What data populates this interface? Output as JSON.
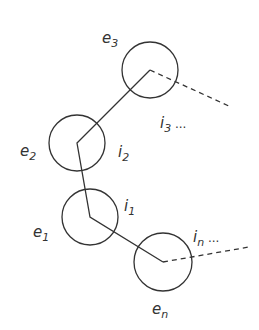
{
  "diagram": {
    "nodes": [
      {
        "id": "e3",
        "label": "e",
        "sub": "3",
        "cx": 150,
        "cy": 70,
        "r": 28,
        "lx": 102,
        "ly": 43
      },
      {
        "id": "e2",
        "label": "e",
        "sub": "2",
        "cx": 77,
        "cy": 143,
        "r": 28,
        "lx": 20,
        "ly": 156
      },
      {
        "id": "e1",
        "label": "e",
        "sub": "1",
        "cx": 90,
        "cy": 217,
        "r": 28,
        "lx": 33,
        "ly": 237
      },
      {
        "id": "en",
        "label": "e",
        "sub": "n",
        "cx": 163,
        "cy": 262,
        "r": 29,
        "lx": 152,
        "ly": 314
      }
    ],
    "index_labels": [
      {
        "id": "i3",
        "label": "i",
        "sub": "3",
        "suffix": " ...",
        "x": 160,
        "y": 128
      },
      {
        "id": "i2",
        "label": "i",
        "sub": "2",
        "suffix": "",
        "x": 118,
        "y": 157
      },
      {
        "id": "i1",
        "label": "i",
        "sub": "1",
        "suffix": "",
        "x": 124,
        "y": 211
      },
      {
        "id": "in",
        "label": "i",
        "sub": "n",
        "suffix": " ...",
        "x": 193,
        "y": 242
      }
    ],
    "stroke_color": "#333333"
  }
}
